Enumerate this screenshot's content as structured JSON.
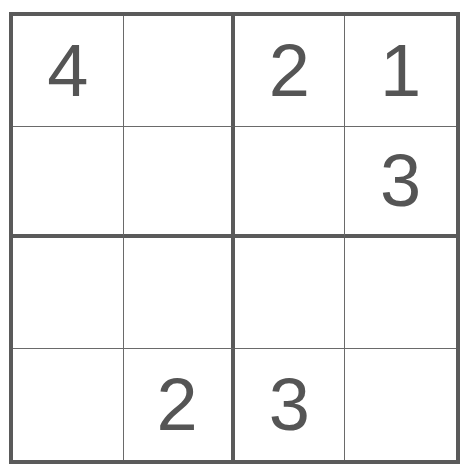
{
  "puzzle": {
    "type": "4x4 sudoku",
    "colors": {
      "line": "#5a5a5a",
      "digit": "#555555",
      "background": "#ffffff"
    },
    "cells": [
      [
        "4",
        "",
        "2",
        "1"
      ],
      [
        "",
        "",
        "",
        "3"
      ],
      [
        "",
        "",
        "",
        ""
      ],
      [
        "",
        "2",
        "3",
        ""
      ]
    ]
  }
}
